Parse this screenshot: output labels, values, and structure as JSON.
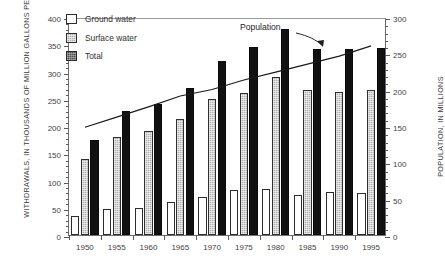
{
  "chart_data": {
    "type": "bar",
    "title": "",
    "subtitle": "",
    "xlabel": "",
    "ylabel": "WITHDRAWALS, IN THOUSANDS OF MILLION GALLONS PER DAY",
    "y2label": "POPULATION, IN MILLIONS",
    "categories": [
      "1950",
      "1955",
      "1960",
      "1965",
      "1970",
      "1975",
      "1980",
      "1985",
      "1990",
      "1995"
    ],
    "ylim": [
      0,
      400
    ],
    "y2lim": [
      0,
      300
    ],
    "yticks": [
      0,
      50,
      100,
      150,
      200,
      250,
      300,
      350,
      400
    ],
    "y2ticks": [
      0,
      50,
      100,
      150,
      200,
      250,
      300
    ],
    "grid": false,
    "legend_position": "upper-left",
    "series": [
      {
        "name": "Ground water",
        "axis": "left",
        "fill": "white",
        "values": [
          35,
          47,
          50,
          60,
          70,
          82,
          85,
          73,
          79,
          77
        ]
      },
      {
        "name": "Surface water",
        "axis": "left",
        "fill": "gray-stipple",
        "values": [
          140,
          180,
          190,
          212,
          250,
          260,
          290,
          267,
          262,
          267
        ]
      },
      {
        "name": "Total",
        "axis": "left",
        "fill": "black",
        "values": [
          175,
          227,
          240,
          270,
          320,
          345,
          378,
          341,
          342,
          343
        ]
      },
      {
        "name": "Population",
        "type": "line",
        "axis": "right",
        "values": [
          151,
          165,
          179,
          194,
          203,
          216,
          227,
          238,
          249,
          263
        ]
      }
    ],
    "annotations": [
      {
        "text": "Population",
        "target": "population-line"
      }
    ]
  },
  "legend": {
    "items": [
      {
        "label": "Ground water",
        "swatch": "white"
      },
      {
        "label": "Surface water",
        "swatch": "gray-stipple"
      },
      {
        "label": "Total",
        "swatch": "dark-stipple"
      }
    ]
  },
  "colors": {
    "ground_water": "#ffffff",
    "surface_water": "#b2b2b2",
    "total": "#111111",
    "line": "#1a1a1a",
    "axis": "#5a5a5a"
  }
}
